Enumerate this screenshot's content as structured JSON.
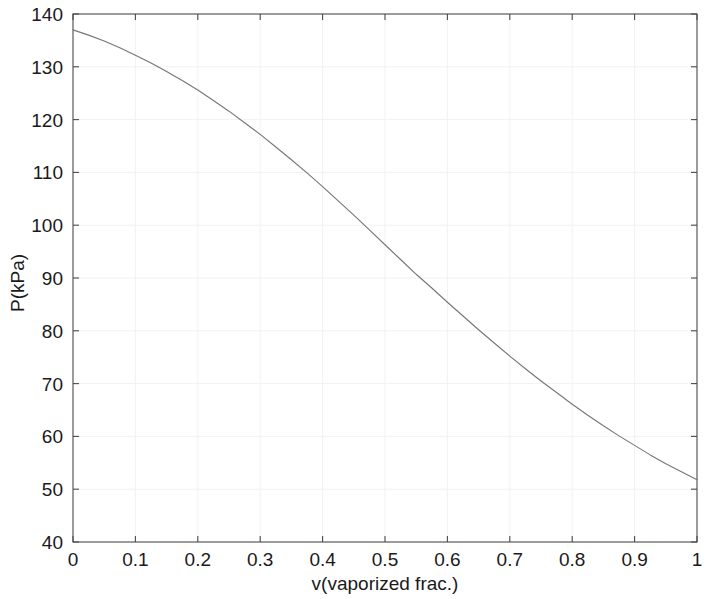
{
  "chart_data": {
    "type": "line",
    "title": "",
    "xlabel": "v(vaporized frac.)",
    "ylabel": "P(kPa)",
    "xlim": [
      0,
      1
    ],
    "ylim": [
      40,
      140
    ],
    "grid": true,
    "legend": null,
    "xticks": [
      "0",
      "0.1",
      "0.2",
      "0.3",
      "0.4",
      "0.5",
      "0.6",
      "0.7",
      "0.8",
      "0.9",
      "1"
    ],
    "xtick_values": [
      0,
      0.1,
      0.2,
      0.3,
      0.4,
      0.5,
      0.6,
      0.7,
      0.8,
      0.9,
      1
    ],
    "yticks": [
      "40",
      "50",
      "60",
      "70",
      "80",
      "90",
      "100",
      "110",
      "120",
      "130",
      "140"
    ],
    "ytick_values": [
      40,
      50,
      60,
      70,
      80,
      90,
      100,
      110,
      120,
      130,
      140
    ],
    "series": [
      {
        "name": "P vs v",
        "color": "#777777",
        "x": [
          0,
          0.025,
          0.05,
          0.075,
          0.1,
          0.125,
          0.15,
          0.175,
          0.2,
          0.225,
          0.25,
          0.275,
          0.3,
          0.325,
          0.35,
          0.375,
          0.4,
          0.425,
          0.45,
          0.475,
          0.5,
          0.525,
          0.55,
          0.575,
          0.6,
          0.625,
          0.65,
          0.675,
          0.7,
          0.725,
          0.75,
          0.775,
          0.8,
          0.825,
          0.85,
          0.875,
          0.9,
          0.925,
          0.95,
          0.975,
          1
        ],
        "y": [
          137.0,
          136.0,
          134.9,
          133.6,
          132.2,
          130.7,
          129.1,
          127.4,
          125.6,
          123.6,
          121.6,
          119.4,
          117.2,
          114.8,
          112.4,
          109.9,
          107.3,
          104.6,
          101.9,
          99.1,
          96.3,
          93.5,
          90.7,
          88.1,
          85.4,
          82.8,
          80.2,
          77.7,
          75.2,
          72.8,
          70.5,
          68.3,
          66.1,
          64.0,
          62.0,
          60.1,
          58.3,
          56.5,
          54.8,
          53.3,
          51.8
        ]
      }
    ]
  },
  "axes": {
    "x_label": "v(vaporized frac.)",
    "y_label": "P(kPa)"
  }
}
